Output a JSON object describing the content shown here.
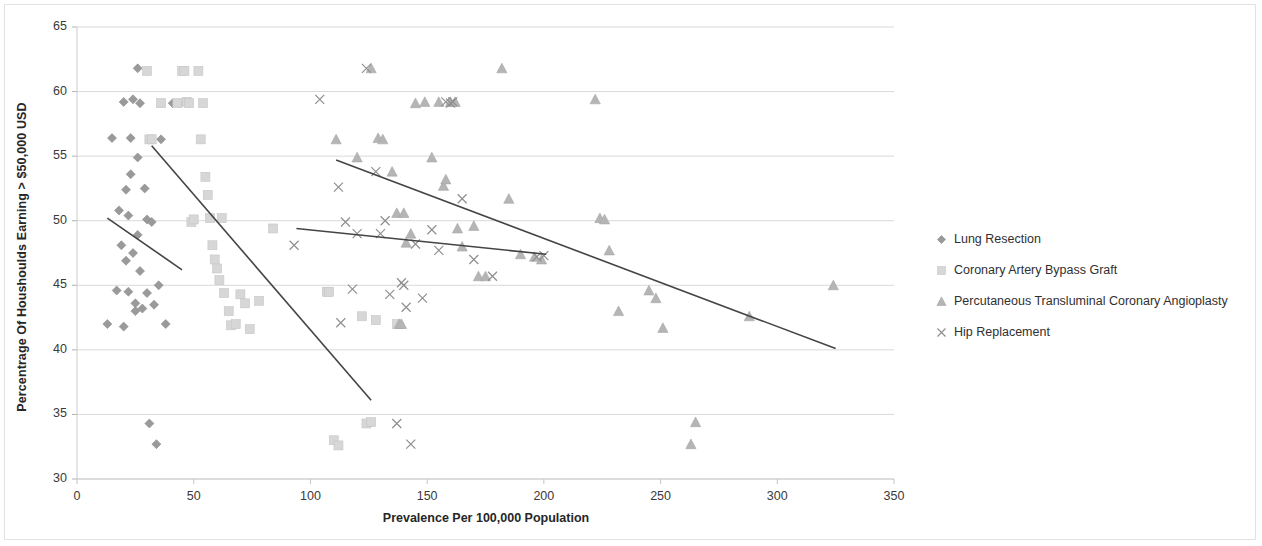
{
  "chart_data": {
    "type": "scatter",
    "title": "",
    "xlabel": "Prevalence Per 100,000 Population",
    "ylabel": "Percentrage Of Houshoulds Earning > $50,000 USD",
    "xlim": [
      0,
      350
    ],
    "ylim": [
      30,
      65
    ],
    "xticks": [
      0,
      50,
      100,
      150,
      200,
      250,
      300,
      350
    ],
    "yticks": [
      30,
      35,
      40,
      45,
      50,
      55,
      60,
      65
    ],
    "grid": "horizontal",
    "legend_position": "right",
    "series": [
      {
        "name": "Lung Resection",
        "marker": "diamond",
        "color": "#9a9a9a",
        "points": [
          [
            13,
            42.0
          ],
          [
            15,
            56.4
          ],
          [
            17,
            44.6
          ],
          [
            18,
            50.8
          ],
          [
            19,
            48.1
          ],
          [
            20,
            59.2
          ],
          [
            20,
            41.8
          ],
          [
            21,
            52.4
          ],
          [
            21,
            46.9
          ],
          [
            22,
            50.4
          ],
          [
            22,
            44.5
          ],
          [
            23,
            56.4
          ],
          [
            23,
            53.6
          ],
          [
            24,
            59.4
          ],
          [
            24,
            47.5
          ],
          [
            25,
            43.6
          ],
          [
            25,
            43.0
          ],
          [
            26,
            61.8
          ],
          [
            26,
            54.9
          ],
          [
            26,
            48.9
          ],
          [
            27,
            59.1
          ],
          [
            27,
            46.1
          ],
          [
            28,
            43.2
          ],
          [
            29,
            52.5
          ],
          [
            30,
            50.1
          ],
          [
            30,
            44.4
          ],
          [
            31,
            34.3
          ],
          [
            32,
            49.9
          ],
          [
            33,
            43.5
          ],
          [
            34,
            32.7
          ],
          [
            35,
            45.0
          ],
          [
            36,
            56.3
          ],
          [
            38,
            42.0
          ],
          [
            41,
            59.1
          ],
          [
            44,
            59.1
          ]
        ]
      },
      {
        "name": "Coronary Artery Bypass Graft",
        "marker": "square",
        "color": "#d7d7d7",
        "points": [
          [
            30,
            61.6
          ],
          [
            31,
            56.3
          ],
          [
            32,
            56.3
          ],
          [
            36,
            59.1
          ],
          [
            43,
            59.1
          ],
          [
            45,
            61.6
          ],
          [
            46,
            61.6
          ],
          [
            47,
            59.2
          ],
          [
            48,
            59.1
          ],
          [
            49,
            49.9
          ],
          [
            50,
            50.1
          ],
          [
            52,
            61.6
          ],
          [
            53,
            56.3
          ],
          [
            54,
            59.1
          ],
          [
            55,
            53.4
          ],
          [
            56,
            52.0
          ],
          [
            57,
            50.2
          ],
          [
            58,
            48.1
          ],
          [
            59,
            47.0
          ],
          [
            60,
            46.3
          ],
          [
            61,
            45.4
          ],
          [
            62,
            50.2
          ],
          [
            63,
            44.4
          ],
          [
            65,
            43.0
          ],
          [
            66,
            41.9
          ],
          [
            68,
            42.0
          ],
          [
            70,
            44.3
          ],
          [
            72,
            43.6
          ],
          [
            74,
            41.6
          ],
          [
            78,
            43.8
          ],
          [
            84,
            49.4
          ],
          [
            107,
            44.5
          ],
          [
            108,
            44.5
          ],
          [
            110,
            33.0
          ],
          [
            112,
            32.6
          ],
          [
            122,
            42.6
          ],
          [
            124,
            34.3
          ],
          [
            126,
            34.4
          ],
          [
            128,
            42.3
          ],
          [
            137,
            42.0
          ]
        ]
      },
      {
        "name": "Percutaneous Transluminal Coronary Angioplasty",
        "marker": "triangle",
        "color": "#b5b5b5",
        "points": [
          [
            111,
            56.3
          ],
          [
            120,
            54.9
          ],
          [
            126,
            61.8
          ],
          [
            129,
            56.4
          ],
          [
            131,
            56.3
          ],
          [
            135,
            53.8
          ],
          [
            137,
            50.6
          ],
          [
            138,
            42.0
          ],
          [
            139,
            42.0
          ],
          [
            140,
            50.6
          ],
          [
            141,
            48.3
          ],
          [
            143,
            49.0
          ],
          [
            145,
            59.1
          ],
          [
            149,
            59.2
          ],
          [
            152,
            54.9
          ],
          [
            155,
            59.2
          ],
          [
            157,
            52.7
          ],
          [
            158,
            53.2
          ],
          [
            160,
            59.2
          ],
          [
            162,
            59.2
          ],
          [
            163,
            49.4
          ],
          [
            165,
            48.0
          ],
          [
            170,
            49.6
          ],
          [
            172,
            45.7
          ],
          [
            175,
            45.7
          ],
          [
            182,
            61.8
          ],
          [
            185,
            51.7
          ],
          [
            190,
            47.4
          ],
          [
            196,
            47.2
          ],
          [
            199,
            47.0
          ],
          [
            222,
            59.4
          ],
          [
            224,
            50.2
          ],
          [
            226,
            50.1
          ],
          [
            228,
            47.7
          ],
          [
            232,
            43.0
          ],
          [
            245,
            44.6
          ],
          [
            248,
            44.0
          ],
          [
            251,
            41.7
          ],
          [
            263,
            32.7
          ],
          [
            265,
            34.4
          ],
          [
            288,
            42.6
          ],
          [
            324,
            45.0
          ]
        ]
      },
      {
        "name": "Hip Replacement",
        "marker": "x",
        "color": "#8f8f8f",
        "points": [
          [
            93,
            48.1
          ],
          [
            104,
            59.4
          ],
          [
            112,
            52.6
          ],
          [
            113,
            42.1
          ],
          [
            115,
            49.9
          ],
          [
            118,
            44.7
          ],
          [
            120,
            49.0
          ],
          [
            124,
            61.8
          ],
          [
            128,
            53.8
          ],
          [
            130,
            49.0
          ],
          [
            132,
            50.0
          ],
          [
            134,
            44.3
          ],
          [
            137,
            34.3
          ],
          [
            139,
            45.2
          ],
          [
            140,
            45.0
          ],
          [
            141,
            43.3
          ],
          [
            143,
            32.7
          ],
          [
            145,
            48.2
          ],
          [
            148,
            44.0
          ],
          [
            152,
            49.3
          ],
          [
            155,
            47.7
          ],
          [
            158,
            59.2
          ],
          [
            160,
            59.1
          ],
          [
            161,
            59.2
          ],
          [
            165,
            51.7
          ],
          [
            170,
            47.0
          ],
          [
            178,
            45.7
          ],
          [
            197,
            47.2
          ],
          [
            200,
            47.3
          ]
        ]
      }
    ],
    "trendlines": [
      {
        "series": "Lung Resection",
        "x0": 13,
        "y0": 50.2,
        "x1": 45,
        "y1": 46.2
      },
      {
        "series": "Coronary Artery Bypass Graft",
        "x0": 32,
        "y0": 55.8,
        "x1": 126,
        "y1": 36.1
      },
      {
        "series": "Percutaneous Transluminal Coronary Angioplasty",
        "x0": 111,
        "y0": 54.7,
        "x1": 325,
        "y1": 40.1
      },
      {
        "series": "Hip Replacement",
        "x0": 94,
        "y0": 49.4,
        "x1": 201,
        "y1": 47.4
      }
    ]
  },
  "legend": {
    "items": [
      {
        "label": "Lung Resection",
        "marker": "diamond-marker-icon"
      },
      {
        "label": "Coronary Artery Bypass Graft",
        "marker": "square-marker-icon"
      },
      {
        "label": "Percutaneous Transluminal Coronary Angioplasty",
        "marker": "triangle-marker-icon"
      },
      {
        "label": "Hip Replacement",
        "marker": "x-marker-icon"
      }
    ]
  }
}
